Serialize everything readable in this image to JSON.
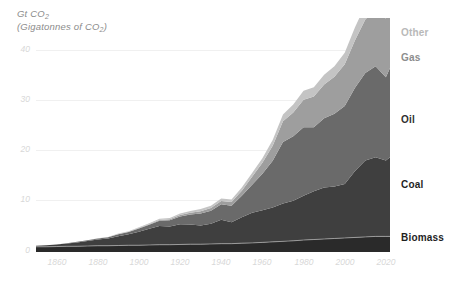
{
  "chart_data": {
    "type": "area",
    "stacked": true,
    "title": "Gt CO2",
    "subtitle": "(Gigatonnes of CO2)",
    "ylabel": "Gt CO2",
    "xlabel": "",
    "grid": true,
    "legend_position": "right-inline",
    "xlim": [
      1850,
      2022
    ],
    "ylim": [
      0,
      45
    ],
    "yticks": [
      0,
      10,
      20,
      30,
      40
    ],
    "ytick_labels": [
      "0",
      "10",
      "20",
      "30",
      "40"
    ],
    "xticks": [
      1860,
      1880,
      1900,
      1920,
      1940,
      1960,
      1980,
      2000,
      2020
    ],
    "xtick_labels": [
      "1860",
      "1880",
      "1900",
      "1920",
      "1940",
      "1960",
      "1980",
      "2000",
      "2020"
    ],
    "x": [
      1850,
      1855,
      1860,
      1865,
      1870,
      1875,
      1880,
      1885,
      1890,
      1895,
      1900,
      1905,
      1910,
      1915,
      1920,
      1925,
      1930,
      1935,
      1940,
      1945,
      1950,
      1955,
      1960,
      1965,
      1970,
      1975,
      1980,
      1985,
      1990,
      1995,
      2000,
      2005,
      2010,
      2015,
      2020,
      2022
    ],
    "series": [
      {
        "name": "Biomass",
        "color": "#2a2a2a",
        "values": [
          1.0,
          1.0,
          1.05,
          1.1,
          1.1,
          1.15,
          1.2,
          1.2,
          1.25,
          1.3,
          1.3,
          1.35,
          1.4,
          1.4,
          1.45,
          1.5,
          1.5,
          1.55,
          1.6,
          1.6,
          1.7,
          1.75,
          1.85,
          1.95,
          2.05,
          2.15,
          2.3,
          2.4,
          2.5,
          2.6,
          2.7,
          2.8,
          2.9,
          3.0,
          3.0,
          3.0
        ]
      },
      {
        "name": "Coal",
        "color": "#3f3f3f",
        "values": [
          0.2,
          0.3,
          0.4,
          0.55,
          0.75,
          0.95,
          1.2,
          1.4,
          1.8,
          2.1,
          2.6,
          3.1,
          3.6,
          3.5,
          3.9,
          3.8,
          3.6,
          3.9,
          4.6,
          4.1,
          5.0,
          5.8,
          6.2,
          6.6,
          7.3,
          7.7,
          8.5,
          9.3,
          9.9,
          10.0,
          10.4,
          12.8,
          14.7,
          15.2,
          14.6,
          15.2
        ]
      },
      {
        "name": "Oil",
        "color": "#6a6a6a",
        "values": [
          0.0,
          0.0,
          0.0,
          0.05,
          0.1,
          0.15,
          0.2,
          0.25,
          0.35,
          0.45,
          0.6,
          0.8,
          1.0,
          1.2,
          1.5,
          1.9,
          2.3,
          2.5,
          3.0,
          3.2,
          4.1,
          5.4,
          7.0,
          9.0,
          11.8,
          12.4,
          13.2,
          12.3,
          13.3,
          14.0,
          15.0,
          16.0,
          16.8,
          17.5,
          16.0,
          17.2
        ]
      },
      {
        "name": "Gas",
        "color": "#9e9e9e",
        "values": [
          0.0,
          0.0,
          0.0,
          0.0,
          0.0,
          0.0,
          0.0,
          0.0,
          0.05,
          0.05,
          0.1,
          0.1,
          0.15,
          0.2,
          0.25,
          0.35,
          0.45,
          0.5,
          0.6,
          0.7,
          1.0,
          1.5,
          2.1,
          2.9,
          4.0,
          4.6,
          5.3,
          5.9,
          6.5,
          7.1,
          8.0,
          9.1,
          10.3,
          11.0,
          11.3,
          11.9
        ]
      },
      {
        "name": "Other",
        "color": "#c4c4c4",
        "values": [
          0.0,
          0.0,
          0.0,
          0.0,
          0.0,
          0.0,
          0.05,
          0.05,
          0.1,
          0.1,
          0.15,
          0.2,
          0.25,
          0.25,
          0.3,
          0.35,
          0.4,
          0.45,
          0.5,
          0.5,
          0.6,
          0.75,
          0.9,
          1.1,
          1.3,
          1.5,
          1.7,
          1.8,
          1.9,
          2.0,
          2.2,
          2.5,
          2.8,
          3.0,
          3.1,
          3.3
        ]
      }
    ],
    "legend_entries": [
      {
        "label": "Other",
        "color": "#b9b9b9"
      },
      {
        "label": "Gas",
        "color": "#8d8d8d"
      },
      {
        "label": "Oil",
        "color": "#333333"
      },
      {
        "label": "Coal",
        "color": "#222222"
      },
      {
        "label": "Biomass",
        "color": "#222222"
      }
    ]
  },
  "series_labels": {
    "other": "Other",
    "gas": "Gas",
    "oil": "Oil",
    "coal": "Coal",
    "biomass": "Biomass"
  },
  "yticks": {
    "t0": "0",
    "t10": "10",
    "t20": "20",
    "t30": "30",
    "t40": "40"
  },
  "xticks": {
    "x1860": "1860",
    "x1880": "1880",
    "x1900": "1900",
    "x1920": "1920",
    "x1940": "1940",
    "x1960": "1960",
    "x1980": "1980",
    "x2000": "2000",
    "x2020": "2020"
  },
  "colors": {
    "biomass": "#2a2a2a",
    "coal": "#3f3f3f",
    "oil": "#6a6a6a",
    "gas": "#9e9e9e",
    "other": "#c4c4c4",
    "grid": "#f0f0f0",
    "tick_text": "#d8d8d8",
    "title_text": "#8c8c8c"
  }
}
